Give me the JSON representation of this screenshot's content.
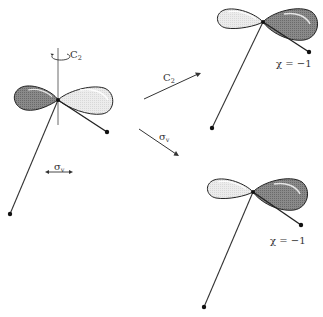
{
  "diagram": {
    "type": "symmetry-operations",
    "colors": {
      "dark_lobe": "#7a7a7a",
      "light_lobe": "#e6e6e6",
      "outline": "#222222",
      "stick": "#333333"
    },
    "original": {
      "axis_label": "C",
      "axis_label_sub": "2",
      "mirror_label": "σ",
      "mirror_label_sub": "v"
    },
    "operations": [
      {
        "label": "C",
        "label_sub": "2",
        "result": "χ = −1"
      },
      {
        "label": "σ",
        "label_sub": "v",
        "result": "χ = −1"
      }
    ]
  }
}
